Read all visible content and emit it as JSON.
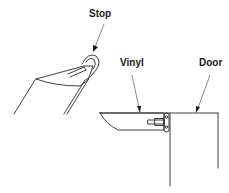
{
  "diagram": {
    "type": "technical-illustration",
    "labels": {
      "stop": "Stop",
      "vinyl": "Vinyl",
      "door": "Door"
    },
    "views": [
      {
        "name": "angled-view",
        "callouts": [
          "Stop"
        ]
      },
      {
        "name": "installed-view",
        "callouts": [
          "Vinyl",
          "Door"
        ]
      }
    ]
  }
}
